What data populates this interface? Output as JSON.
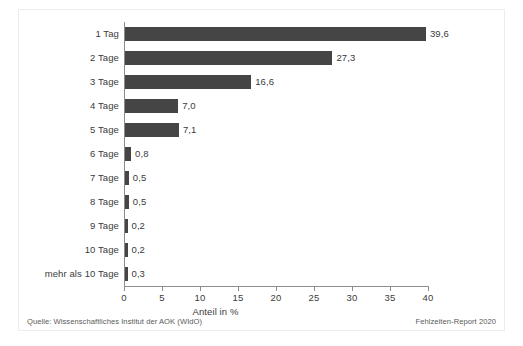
{
  "chart_data": {
    "type": "bar",
    "orientation": "horizontal",
    "title": "",
    "subtitle": "",
    "xlabel": "Anteil in %",
    "ylabel": "",
    "xlim": [
      0,
      40
    ],
    "xticks": [
      "0",
      "5",
      "10",
      "15",
      "20",
      "25",
      "30",
      "35",
      "40"
    ],
    "xtick_values": [
      0,
      5,
      10,
      15,
      20,
      25,
      30,
      35,
      40
    ],
    "grid": false,
    "legend": null,
    "categories": [
      "1 Tag",
      "2 Tage",
      "3 Tage",
      "4 Tage",
      "5 Tage",
      "6 Tage",
      "7 Tage",
      "8 Tage",
      "9 Tage",
      "10 Tage",
      "mehr als 10 Tage"
    ],
    "values": [
      39.6,
      27.3,
      16.6,
      7.0,
      7.1,
      0.8,
      0.5,
      0.5,
      0.2,
      0.2,
      0.3
    ],
    "value_labels": [
      "39,6",
      "27,3",
      "16,6",
      "7,0",
      "7,1",
      "0,8",
      "0,5",
      "0,5",
      "0,2",
      "0,2",
      "0,3"
    ],
    "bar_color": "#454545",
    "axis_color": "#8d8d8d",
    "text_color": "#3b3b3b",
    "background_color": "#ffffff"
  },
  "footer": {
    "source": "Quelle: Wissenschaftliches Institut der AOK (WIdO)",
    "report": "Fehlzeiten-Report 2020"
  }
}
